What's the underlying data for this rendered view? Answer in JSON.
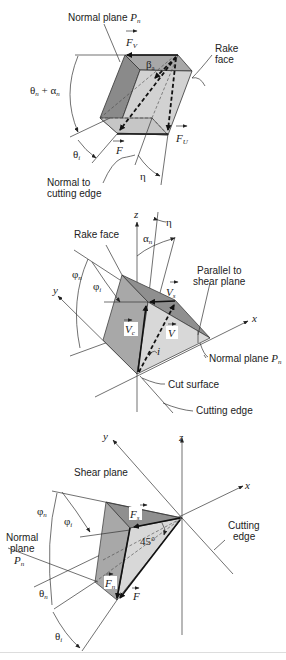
{
  "figure": {
    "panels": [
      {
        "id": "panel-top",
        "labels": {
          "normal_plane": "Normal plane",
          "normal_plane_sym": "P",
          "normal_plane_sub": "n",
          "rake_face_1": "Rake",
          "rake_face_2": "face",
          "fv": "F",
          "fv_sub": "V",
          "fu": "F",
          "fu_sub": "U",
          "f": "F",
          "beta": "β",
          "beta_sub": "a",
          "theta_alpha": "θ",
          "theta_alpha_sub1": "n",
          "theta_alpha_plus": " + α",
          "theta_alpha_sub2": "n",
          "theta_i": "θ",
          "theta_i_sub": "i",
          "eta": "η",
          "normal_to_1": "Normal to",
          "normal_to_2": "cutting edge"
        }
      },
      {
        "id": "panel-middle",
        "labels": {
          "z": "z",
          "eta": "η",
          "alpha": "α",
          "alpha_sub": "n",
          "rake_face": "Rake face",
          "phi_n": "φ",
          "phi_n_sub": "n",
          "phi_i": "φ",
          "phi_i_sub": "i",
          "y": "y",
          "x": "x",
          "parallel_1": "Parallel to",
          "parallel_2": "shear plane",
          "vs": "V",
          "vs_sub": "s",
          "vc": "V",
          "vc_sub": "c",
          "v": "V",
          "i": "i",
          "normal_plane": "Normal plane",
          "normal_plane_sym": "P",
          "normal_plane_sub": "n",
          "cut_surface": "Cut surface",
          "cutting_edge": "Cutting edge"
        }
      },
      {
        "id": "panel-bottom",
        "labels": {
          "y": "y",
          "z": "z",
          "x": "x",
          "shear_plane": "Shear plane",
          "phi_n": "φ",
          "phi_n_sub": "n",
          "phi_i": "φ",
          "phi_i_sub": "i",
          "normal_1": "Normal",
          "normal_2": "plane",
          "normal_sym": "P",
          "normal_sub": "n",
          "fs": "F",
          "fs_sub": "s",
          "fn": "F",
          "fn_sub": "n",
          "f": "F",
          "angle45": "45°",
          "theta_n": "θ",
          "theta_n_sub": "n",
          "theta_i": "θ",
          "theta_i_sub": "i",
          "cutting_1": "Cutting",
          "cutting_2": "edge"
        }
      }
    ],
    "colors": {
      "dark_face": "#8a8a8a",
      "mid_face": "#b0b0b0",
      "light_face": "#d6d6d6",
      "top_face": "#a8a8a8",
      "line": "#333333",
      "background": "#ffffff"
    }
  }
}
